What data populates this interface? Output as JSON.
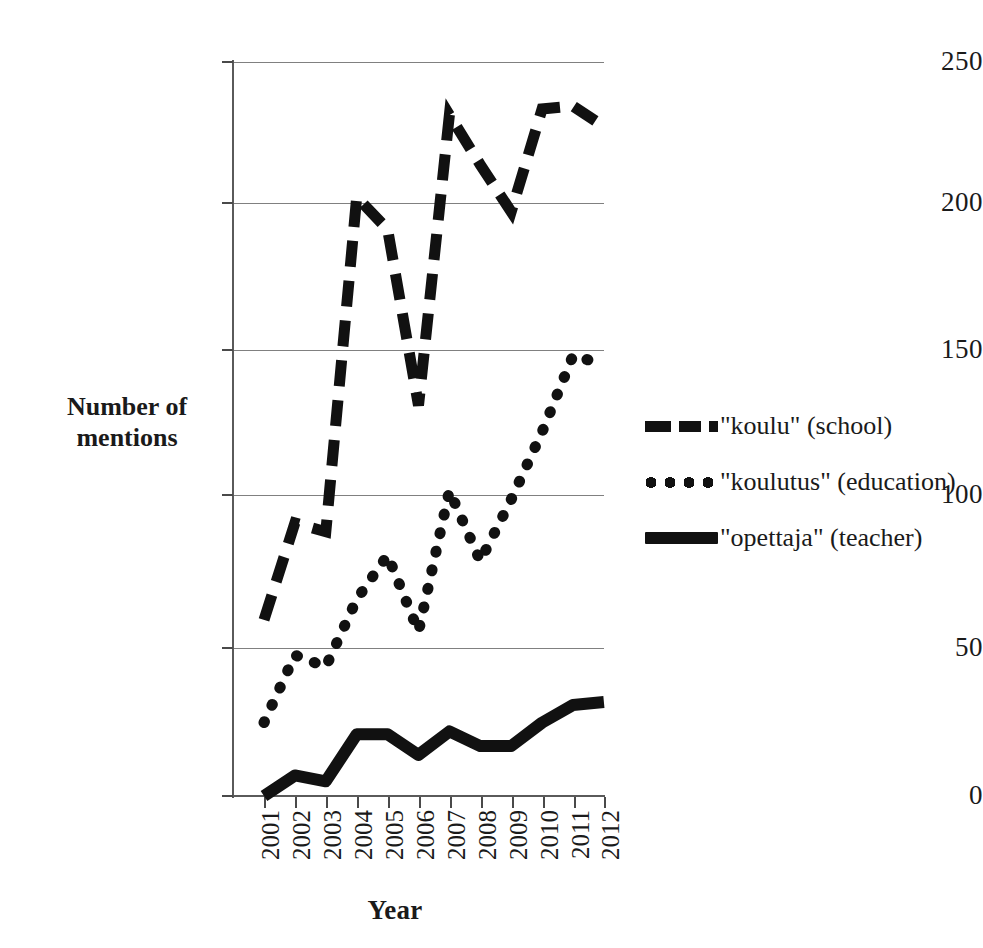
{
  "chart_data": {
    "type": "line",
    "title": "",
    "xlabel": "Year",
    "ylabel": "Number of mentions",
    "categories": [
      "2001",
      "2002",
      "2003",
      "2004",
      "2005",
      "2006",
      "2007",
      "2008",
      "2009",
      "2010",
      "2011",
      "2012"
    ],
    "x": [
      2001,
      2002,
      2003,
      2004,
      2005,
      2006,
      2007,
      2008,
      2009,
      2010,
      2011,
      2012
    ],
    "ylim": [
      0,
      250
    ],
    "yticks": [
      0,
      50,
      100,
      150,
      200,
      250
    ],
    "grid": "horizontal",
    "legend_position": "right",
    "series": [
      {
        "name": "\"koulu\" (school)",
        "style": "dashed",
        "color": "#111111",
        "values": [
          60,
          93,
          90,
          204,
          193,
          133,
          232,
          215,
          199,
          234,
          235,
          228
        ]
      },
      {
        "name": "\"koulutus\" (education)",
        "style": "dotted",
        "color": "#111111",
        "values": [
          25,
          48,
          44,
          67,
          82,
          56,
          104,
          80,
          101,
          124,
          150,
          147
        ]
      },
      {
        "name": "\"opettaja\" (teacher)",
        "style": "solid",
        "color": "#111111",
        "values": [
          0,
          7,
          5,
          21,
          21,
          14,
          22,
          17,
          17,
          25,
          31,
          32
        ]
      }
    ]
  },
  "axes": {
    "y_title_line1": "Number of",
    "y_title_line2": "mentions",
    "x_title": "Year",
    "y_tick_labels": [
      "0",
      "50",
      "100",
      "150",
      "200",
      "250"
    ],
    "x_tick_labels": [
      "2001",
      "2002",
      "2003",
      "2004",
      "2005",
      "2006",
      "2007",
      "2008",
      "2009",
      "2010",
      "2011",
      "2012"
    ]
  },
  "legend": {
    "items": [
      {
        "label": "\"koulu\" (school)",
        "style": "dashed"
      },
      {
        "label": "\"koulutus\" (education)",
        "style": "dotted"
      },
      {
        "label": "\"opettaja\" (teacher)",
        "style": "solid"
      }
    ]
  }
}
